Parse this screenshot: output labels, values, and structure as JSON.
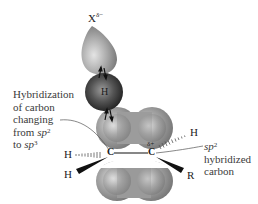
{
  "diagram": {
    "type": "orbital-transition-state",
    "colors": {
      "lobe_fill": "#8c8c8c",
      "lobe_highlight": "#d8d8d8",
      "h_sphere": "#3c3c3c",
      "text": "#3a3a3a",
      "bond": "#111111"
    },
    "atoms": {
      "x_symbol": "X",
      "x_charge": "δ−",
      "h_bridge": "H",
      "c_left": "C",
      "c_right": "C",
      "c_right_charge": "δ+",
      "h_left_hashed": "H",
      "h_left_wedge": "H",
      "h_right_hashed": "H",
      "r_right_wedge": "R"
    },
    "left_annotation": {
      "line1": "Hybridization",
      "line2": "of carbon",
      "line3": "changing",
      "line4_prefix": "from ",
      "line4_italic": "sp",
      "line4_sup": "2",
      "line5_prefix": "to ",
      "line5_italic": "sp",
      "line5_sup": "3"
    },
    "right_annotation": {
      "line1_italic": "sp",
      "line1_sup": "2",
      "line2": "hybridized",
      "line3": "carbon"
    }
  }
}
